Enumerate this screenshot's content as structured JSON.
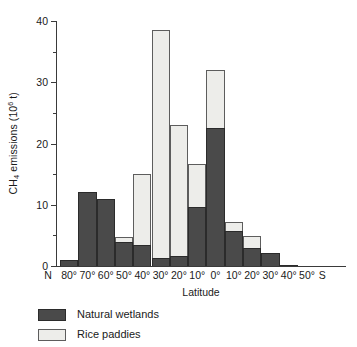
{
  "chart_data": {
    "type": "bar",
    "stacked": true,
    "title": "",
    "subtitle": "",
    "xlabel": "Latitude",
    "ylabel": "CH4 emissions (10^6 t)",
    "ylabel_parts": {
      "prefix": "CH",
      "sub": "4",
      "mid": " emissions (10",
      "sup": "6",
      "suffix": " t)"
    },
    "ylim": [
      0,
      40
    ],
    "yticks": [
      0,
      10,
      20,
      30,
      40
    ],
    "yticklabels": [
      "0",
      "10",
      "20",
      "30",
      "40"
    ],
    "yminorticks": [
      5,
      15,
      25,
      35
    ],
    "grid": false,
    "legend_position": "below-left",
    "axis_end_labels": {
      "left": "N",
      "right": "S"
    },
    "categories": [
      "80°",
      "70°",
      "60°",
      "50°",
      "40°",
      "30°",
      "20°",
      "10°",
      "0°",
      "10°",
      "20°",
      "30°",
      "40°",
      "50°"
    ],
    "series": [
      {
        "name": "Natural wetlands",
        "color": "#4a4a4a",
        "values": [
          1.0,
          12.1,
          11.0,
          4.0,
          3.4,
          1.3,
          1.7,
          9.6,
          22.6,
          5.7,
          2.9,
          2.2,
          0.2,
          0.0
        ]
      },
      {
        "name": "Rice paddies",
        "color": "#ededea",
        "values": [
          0.0,
          0.0,
          0.0,
          0.8,
          11.6,
          37.2,
          21.3,
          7.0,
          9.4,
          1.5,
          2.0,
          0.0,
          0.0,
          0.0
        ]
      }
    ],
    "totals": [
      1.0,
      12.1,
      11.0,
      4.8,
      15.0,
      38.5,
      23.0,
      16.6,
      32.0,
      7.2,
      4.9,
      2.2,
      0.2,
      0.0
    ]
  },
  "legend": {
    "items": [
      {
        "label": "Natural wetlands",
        "swatch": "dark-gray-swatch"
      },
      {
        "label": "Rice paddies",
        "swatch": "light-gray-swatch"
      }
    ]
  }
}
